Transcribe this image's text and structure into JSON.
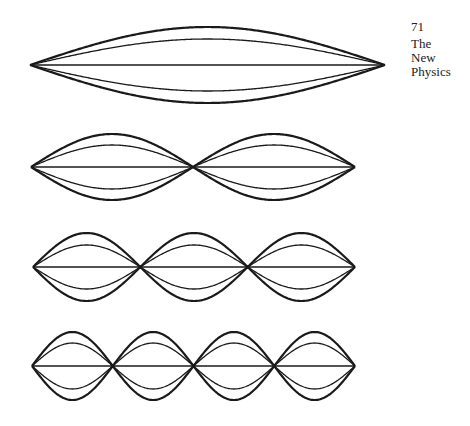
{
  "page": {
    "number": "71",
    "running_head": [
      "The",
      "New",
      "Physics"
    ]
  },
  "figure": {
    "line_color": "#1a1a1a",
    "modes": [
      {
        "harmonic": 1,
        "x_start": 30,
        "x_end": 385,
        "center_y": 65,
        "outer_amp": 38,
        "inner_amp": 26,
        "loops": 1
      },
      {
        "harmonic": 2,
        "x_start": 31,
        "x_end": 355,
        "center_y": 167,
        "outer_amp": 33,
        "inner_amp": 22,
        "loops": 2
      },
      {
        "harmonic": 3,
        "x_start": 33,
        "x_end": 355,
        "center_y": 267,
        "outer_amp": 34,
        "inner_amp": 22,
        "loops": 3
      },
      {
        "harmonic": 4,
        "x_start": 32,
        "x_end": 355,
        "center_y": 366,
        "outer_amp": 34,
        "inner_amp": 23,
        "loops": 4
      }
    ]
  }
}
